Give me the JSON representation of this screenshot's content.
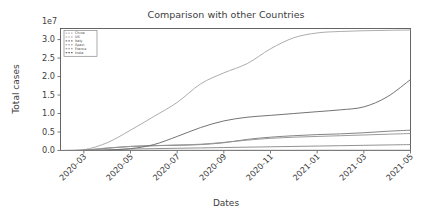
{
  "chart_data": {
    "type": "line",
    "title": "Comparison with other Countries",
    "xlabel": "Dates",
    "ylabel": "Total cases",
    "y_offset_text": "1e7",
    "y_offset_multiplier": 10000000,
    "grid": false,
    "legend_position": "upper left",
    "ylim": [
      0,
      3.3
    ],
    "yticks": [
      0.0,
      0.5,
      1.0,
      1.5,
      2.0,
      2.5,
      3.0
    ],
    "ytick_labels": [
      "0.0",
      "0.5",
      "1.0",
      "1.5",
      "2.0",
      "2.5",
      "3.0"
    ],
    "x": [
      "2020-02",
      "2020-03",
      "2020-04",
      "2020-05",
      "2020-06",
      "2020-07",
      "2020-08",
      "2020-09",
      "2020-10",
      "2020-11",
      "2020-12",
      "2021-01",
      "2021-02",
      "2021-03",
      "2021-04",
      "2021-05"
    ],
    "xticks": [
      "2020-03",
      "2020-05",
      "2020-07",
      "2020-09",
      "2020-11",
      "2021-01",
      "2021-03",
      "2021-05"
    ],
    "xtick_labels": [
      "2020-03",
      "2020-05",
      "2020-07",
      "2020-09",
      "2020-11",
      "2021-01",
      "2021-03",
      "2021-05"
    ],
    "xlim": [
      "2020-02",
      "2021-05"
    ],
    "series": [
      {
        "name": "China",
        "color": "#b9b9b9",
        "values": [
          0.004,
          0.008,
          0.008,
          0.009,
          0.009,
          0.009,
          0.009,
          0.009,
          0.01,
          0.01,
          0.01,
          0.011,
          0.011,
          0.011,
          0.011,
          0.012
        ]
      },
      {
        "name": "US",
        "color": "#a8a8a8",
        "values": [
          0.0,
          0.02,
          0.21,
          0.55,
          0.92,
          1.3,
          1.8,
          2.1,
          2.35,
          2.75,
          3.05,
          3.18,
          3.22,
          3.24,
          3.25,
          3.26
        ]
      },
      {
        "name": "Italy",
        "color": "#7d7d7d",
        "values": [
          0.0,
          0.01,
          0.06,
          0.11,
          0.13,
          0.14,
          0.16,
          0.21,
          0.3,
          0.36,
          0.4,
          0.43,
          0.45,
          0.48,
          0.52,
          0.55
        ]
      },
      {
        "name": "Spain",
        "color": "#969696",
        "values": [
          0.0,
          0.01,
          0.07,
          0.11,
          0.13,
          0.15,
          0.17,
          0.22,
          0.28,
          0.33,
          0.36,
          0.38,
          0.4,
          0.42,
          0.44,
          0.46
        ]
      },
      {
        "name": "France",
        "color": "#8c8c8c",
        "values": [
          0.0,
          0.0,
          0.02,
          0.04,
          0.05,
          0.06,
          0.07,
          0.08,
          0.09,
          0.1,
          0.11,
          0.12,
          0.13,
          0.14,
          0.15,
          0.16
        ]
      },
      {
        "name": "India",
        "color": "#6b6b6b",
        "values": [
          0.0,
          0.0,
          0.01,
          0.05,
          0.16,
          0.38,
          0.62,
          0.8,
          0.9,
          0.95,
          1.0,
          1.05,
          1.1,
          1.18,
          1.45,
          1.92
        ]
      }
    ]
  }
}
